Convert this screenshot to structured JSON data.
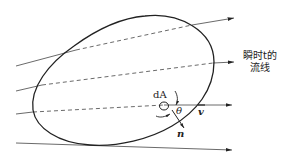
{
  "diagram": {
    "type": "control-volume-streamlines",
    "labels": {
      "streamline_line1": "瞬时t的",
      "streamline_line2": "流线",
      "area_element": "dA",
      "angle": "θ",
      "velocity": "v",
      "normal": "n"
    },
    "colors": {
      "stroke": "#222222",
      "background": "#ffffff"
    }
  }
}
